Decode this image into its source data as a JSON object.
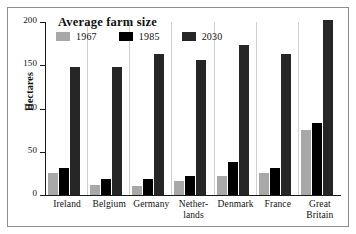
{
  "chart_data": {
    "type": "bar",
    "title": "Average farm size",
    "xlabel": "",
    "ylabel": "Hectares",
    "ylim": [
      0,
      200
    ],
    "yticks": [
      0,
      50,
      100,
      150,
      200
    ],
    "grid": false,
    "legend_position": "top-left",
    "categories": [
      "Ireland",
      "Belgium",
      "Germany",
      "Nether-\nlands",
      "Denmark",
      "France",
      "Great\nBritain"
    ],
    "series": [
      {
        "name": "1967",
        "color": "#a8a8a8",
        "values": [
          25,
          12,
          11,
          16,
          22,
          25,
          75
        ]
      },
      {
        "name": "1985",
        "color": "#000000",
        "values": [
          31,
          19,
          19,
          22,
          38,
          31,
          83
        ]
      },
      {
        "name": "2030",
        "color": "#262626",
        "values": [
          148,
          148,
          163,
          156,
          174,
          163,
          202
        ]
      }
    ]
  },
  "axis": {
    "y_title": "Hectares",
    "tick_labels": [
      "0",
      "50",
      "100",
      "150",
      "200"
    ]
  },
  "x_labels": [
    {
      "line1": "Ireland",
      "line2": ""
    },
    {
      "line1": "Belgium",
      "line2": ""
    },
    {
      "line1": "Germany",
      "line2": ""
    },
    {
      "line1": "Nether-",
      "line2": "lands"
    },
    {
      "line1": "Denmark",
      "line2": ""
    },
    {
      "line1": "France",
      "line2": ""
    },
    {
      "line1": "Great",
      "line2": "Britain"
    }
  ],
  "legend": {
    "entries": [
      {
        "label": "1967",
        "color": "#a8a8a8"
      },
      {
        "label": "1985",
        "color": "#000000"
      },
      {
        "label": "2030",
        "color": "#262626"
      }
    ]
  },
  "colors": {
    "frame": "#8d8d8d",
    "axis": "#1a1a1a",
    "text": "#111111",
    "background": "#ffffff"
  }
}
